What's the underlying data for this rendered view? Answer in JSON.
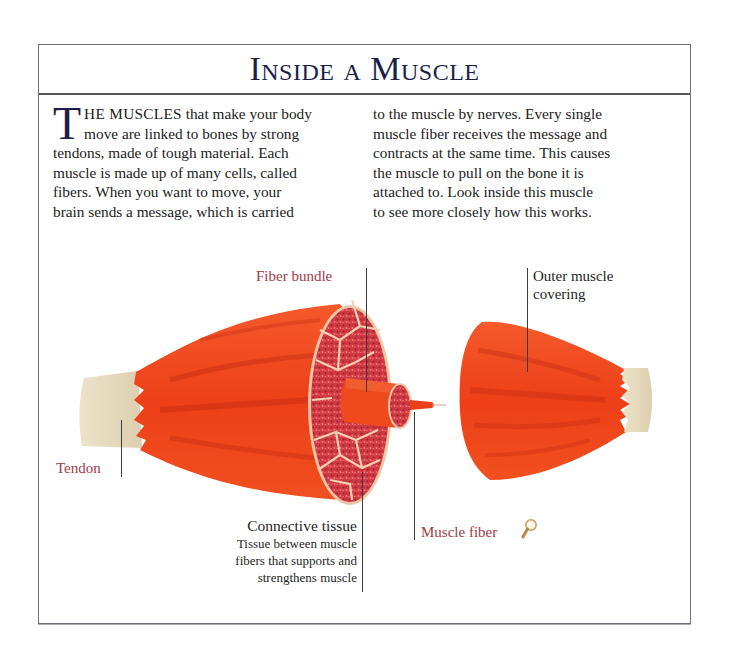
{
  "page": {
    "title": "Inside a Muscle",
    "intro": {
      "drop_cap": "T",
      "lead_caps": "HE MUSCLES",
      "column_left": [
        " that make your body",
        "move are linked to bones by strong",
        "tendons, made of tough material. Each",
        "muscle is made up of many cells, called",
        "fibers. When you want to move, your",
        "brain sends a message, which is carried"
      ],
      "column_right": [
        "to the muscle by nerves. Every single",
        "muscle fiber receives the message and",
        "contracts at the same time. This causes",
        "the muscle to pull on the bone it is",
        "attached to. Look inside this muscle",
        "to see more closely how this works."
      ]
    }
  },
  "illustration": {
    "labels": {
      "fiber_bundle": "Fiber bundle",
      "outer_covering_line1": "Outer muscle",
      "outer_covering_line2": "covering",
      "tendon": "Tendon",
      "connective_tissue": {
        "heading": "Connective tissue",
        "line1": "Tissue between muscle",
        "line2": "fibers that supports and",
        "line3": "strengthens muscle"
      },
      "muscle_fiber": "Muscle fiber"
    },
    "icons": {
      "magnifier": "magnifying-glass-icon"
    },
    "colors": {
      "muscle": "#f0441c",
      "muscle_dark": "#c8301a",
      "fiber_bundle_fill": "#d9424a",
      "fiber_bundle_outline": "#f7c7a8",
      "tendon": "#e4d9bd",
      "label_red": "#a23a47",
      "title_ink": "#1b1f4a"
    }
  }
}
